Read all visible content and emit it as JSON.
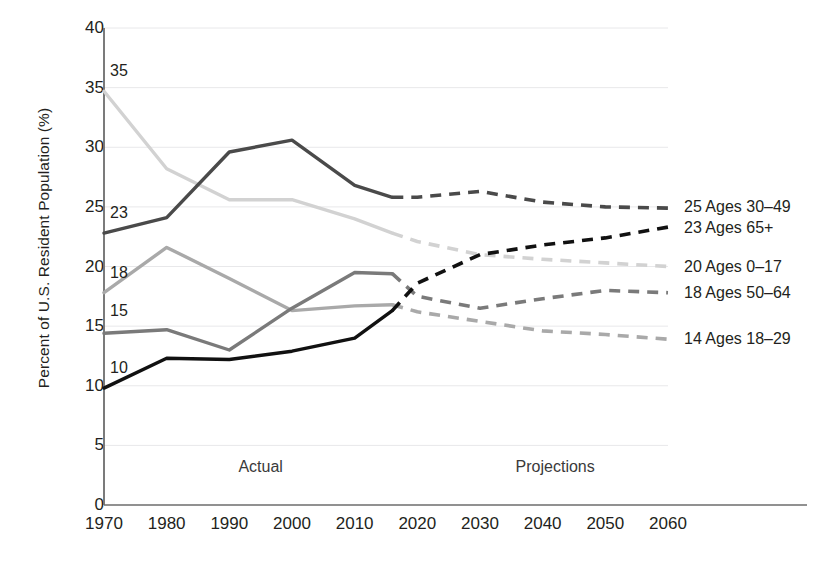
{
  "chart_data": {
    "type": "line",
    "title": "",
    "xlabel": "",
    "ylabel": "Percent of U.S. Resident Population (%)",
    "xlim": [
      1970,
      2060
    ],
    "ylim": [
      0,
      40
    ],
    "yticks": [
      0,
      5,
      10,
      15,
      20,
      25,
      30,
      35,
      40
    ],
    "xticks": [
      1970,
      1980,
      1990,
      2000,
      2010,
      2020,
      2030,
      2040,
      2050,
      2060
    ],
    "grid": "horizontal",
    "legend_position": "right-of-plot-inline",
    "x": [
      1970,
      1980,
      1990,
      2000,
      2010,
      2016,
      2020,
      2030,
      2040,
      2050,
      2060
    ],
    "actual_through": 2016,
    "annotations": [
      {
        "text": "Actual",
        "x": 1995,
        "y": 3.2
      },
      {
        "text": "Projections",
        "x": 2042,
        "y": 3.2
      }
    ],
    "series": [
      {
        "name": "Ages 0–17",
        "legend_label": "20 Ages 0–17",
        "start_label": "35",
        "end_label": "20",
        "end_value": 20,
        "color": "#d2d2d2",
        "values": [
          34.7,
          28.2,
          25.6,
          25.6,
          24.0,
          22.8,
          22.1,
          21.0,
          20.6,
          20.3,
          20.0
        ]
      },
      {
        "name": "Ages 30–49",
        "legend_label": "25 Ages 30–49",
        "start_label": "23",
        "end_label": "25",
        "end_value": 25,
        "color": "#4a4a4a",
        "values": [
          22.8,
          24.1,
          29.6,
          30.6,
          26.8,
          25.8,
          25.8,
          26.3,
          25.4,
          25.0,
          24.9
        ]
      },
      {
        "name": "Ages 18–29",
        "legend_label": "14 Ages 18–29",
        "start_label": "18",
        "end_label": "14",
        "end_value": 14,
        "color": "#a9a9a9",
        "values": [
          17.8,
          21.6,
          19.0,
          16.3,
          16.7,
          16.8,
          16.2,
          15.4,
          14.6,
          14.3,
          13.9
        ]
      },
      {
        "name": "Ages 50–64",
        "legend_label": "18 Ages 50–64",
        "start_label": "15",
        "end_label": "18",
        "end_value": 18,
        "color": "#7a7a7a",
        "values": [
          14.4,
          14.7,
          13.0,
          16.5,
          19.5,
          19.4,
          17.5,
          16.5,
          17.3,
          18.0,
          17.8
        ]
      },
      {
        "name": "Ages 65+",
        "legend_label": "23 Ages 65+",
        "start_label": "10",
        "end_label": "23",
        "end_value": 23,
        "color": "#111111",
        "values": [
          9.8,
          12.3,
          12.2,
          12.9,
          14.0,
          16.3,
          18.6,
          21.0,
          21.8,
          22.4,
          23.3
        ]
      }
    ]
  },
  "axis": {
    "y_title": "Percent of U.S. Resident Population (%)",
    "y_tick_labels": [
      "40",
      "35",
      "30",
      "25",
      "20",
      "15",
      "10",
      "5",
      "0"
    ],
    "x_tick_labels": [
      "1970",
      "1980",
      "1990",
      "2000",
      "2010",
      "2020",
      "2030",
      "2040",
      "2050",
      "2060"
    ]
  },
  "phases": {
    "actual": "Actual",
    "projections": "Projections"
  },
  "legend": {
    "items": [
      {
        "label": "25 Ages 30–49"
      },
      {
        "label": "23 Ages 65+"
      },
      {
        "label": "20 Ages 0–17"
      },
      {
        "label": "18 Ages 50–64"
      },
      {
        "label": "14 Ages 18–29"
      }
    ]
  },
  "start_labels": {
    "items": [
      {
        "label": "35"
      },
      {
        "label": "23"
      },
      {
        "label": "18"
      },
      {
        "label": "15"
      },
      {
        "label": "10"
      }
    ]
  }
}
